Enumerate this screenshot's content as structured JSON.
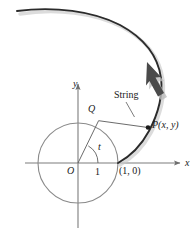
{
  "figure": {
    "colors": {
      "curve": "#2b2b2b",
      "circle": "#8a8a8a",
      "axis": "#7d7d7d",
      "string": "#5a5a5a",
      "radius": "#5a5a5a",
      "label": "#1a1a1a",
      "arrow_shadow": "#b8b8b8",
      "background": "#ffffff"
    },
    "axes": {
      "x_label": "x",
      "y_label": "y",
      "origin_label": "O",
      "unit_tick_label": "1",
      "x_range_px": [
        25,
        182
      ],
      "y_range_px": [
        82,
        228
      ],
      "origin_px": [
        78,
        163
      ]
    },
    "circle": {
      "center_px": [
        78,
        163
      ],
      "radius_px": 40,
      "radius_value": 1
    },
    "points": [
      {
        "name": "Q",
        "label": "Q",
        "px": [
          98,
          120
        ],
        "marker": "none",
        "note": "tangency point on circle"
      },
      {
        "name": "P",
        "label": "P(x, y)",
        "px": [
          148,
          127
        ],
        "marker": "dot",
        "note": "free end of string on involute"
      },
      {
        "name": "start",
        "label": "(1, 0)",
        "px": [
          118,
          163
        ],
        "marker": "none",
        "note": "involute starting point on x-axis"
      }
    ],
    "angle": {
      "label": "t",
      "vertex_px": [
        78,
        163
      ],
      "from_deg": 0,
      "to_deg": 59,
      "arc_radius_px": 20
    },
    "string": {
      "label": "String",
      "from_px": [
        98,
        120
      ],
      "to_px": [
        148,
        127
      ],
      "leader_from_px": [
        125,
        101
      ],
      "leader_to_px": [
        135,
        116
      ]
    },
    "involute": {
      "direction_arrow": "arrowhead pointing up-left along curve",
      "arrow_px": [
        152,
        70
      ],
      "start_px": [
        118,
        163
      ],
      "end_px": [
        17,
        11
      ]
    }
  }
}
